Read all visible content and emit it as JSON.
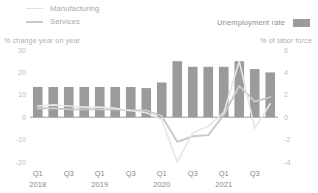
{
  "legend": {
    "manufacturing": "Manufacturing",
    "services": "Services",
    "unemployment": "Unemployment rate"
  },
  "axis_titles": {
    "left": "% change year on year",
    "right": "% of labor force"
  },
  "colors": {
    "bar": "#9b9b9b",
    "manufacturing_line": "#e6e6e6",
    "services_line": "#c9c9c9",
    "axis": "#9a9a9a",
    "tick_text": "#bdbdbd"
  },
  "chart_data": {
    "type": "bar",
    "title": "",
    "xlabel": "",
    "ylabel": "% change year on year",
    "y2label": "% of labor force",
    "grid": false,
    "legend_position": "top",
    "ylim": [
      -20,
      30
    ],
    "y2lim": [
      -4,
      6
    ],
    "yticks": [
      30,
      20,
      10,
      0,
      -10,
      -20
    ],
    "y2ticks": [
      6,
      4,
      2,
      0,
      -2,
      -4
    ],
    "categories": [
      "Q1 2018",
      "Q2 2018",
      "Q3 2018",
      "Q4 2018",
      "Q1 2019",
      "Q2 2019",
      "Q3 2019",
      "Q4 2019",
      "Q1 2020",
      "Q2 2020",
      "Q3 2020",
      "Q4 2020",
      "Q1 2021",
      "Q2 2021",
      "Q3 2021",
      "Q4 2021"
    ],
    "xtick_labels": [
      "Q1",
      "Q3",
      "Q1",
      "Q3",
      "Q1",
      "Q3",
      "Q1",
      "Q3"
    ],
    "xtick_years": [
      "2018",
      "",
      "2019",
      "",
      "2020",
      "",
      "2021",
      ""
    ],
    "series": [
      {
        "name": "Unemployment rate",
        "type": "bar",
        "axis": "right",
        "unit": "% of labor force",
        "values": [
          2.7,
          2.7,
          2.7,
          2.7,
          2.7,
          2.7,
          2.7,
          2.6,
          3.1,
          5.0,
          4.5,
          4.5,
          4.5,
          5.0,
          4.3,
          4.0
        ]
      },
      {
        "name": "Manufacturing",
        "type": "line",
        "axis": "left",
        "unit": "% change year on year",
        "values": [
          5.0,
          5.5,
          5.0,
          4.5,
          4.5,
          4.0,
          3.0,
          2.0,
          -1.0,
          -20.0,
          -7.0,
          -4.0,
          2.0,
          25.0,
          -5.0,
          6.0
        ]
      },
      {
        "name": "Services",
        "type": "line",
        "axis": "left",
        "unit": "% change year on year",
        "values": [
          4.0,
          4.0,
          3.5,
          3.5,
          3.5,
          3.5,
          3.0,
          3.0,
          0.5,
          -11.0,
          -8.5,
          -8.0,
          1.0,
          14.0,
          7.0,
          9.0
        ]
      }
    ]
  }
}
